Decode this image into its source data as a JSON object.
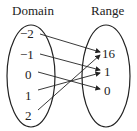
{
  "diagram": {
    "title_domain": "Domain",
    "title_range": "Range",
    "domain": [
      "−2",
      "−1",
      "0",
      "1",
      "2"
    ],
    "range": [
      "16",
      "1",
      "0"
    ],
    "mappings": [
      {
        "from": "−2",
        "to": "16"
      },
      {
        "from": "−1",
        "to": "1"
      },
      {
        "from": "0",
        "to": "0"
      },
      {
        "from": "1",
        "to": "1"
      },
      {
        "from": "2",
        "to": "16"
      }
    ],
    "colors": {
      "stroke": "#222222",
      "background": "#ffffff"
    }
  }
}
